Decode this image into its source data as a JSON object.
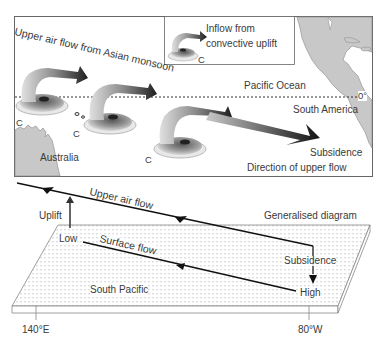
{
  "map": {
    "title_flow": "Upper air flow from Asian monsoon",
    "legend": {
      "line1": "Inflow from",
      "line2": "convective uplift",
      "symbol": "C"
    },
    "ocean_label": "Pacific Ocean",
    "equator_label": "0°",
    "south_america_label": "South America",
    "australia_label": "Australia",
    "subsidence_label": "Subsidence",
    "direction_label": "Direction of upper flow",
    "convection_markers": [
      "C",
      "C",
      "C"
    ]
  },
  "generalised": {
    "title": "Generalised diagram",
    "upper_flow_label": "Upper air flow",
    "uplift_label": "Uplift",
    "low_label": "Low",
    "surface_flow_label": "Surface flow",
    "subsidence_label": "Subsidence",
    "high_label": "High",
    "region_label": "South Pacific",
    "lon_west": "140°E",
    "lon_east": "80°W"
  },
  "colors": {
    "land": "#c8c8c8",
    "arrow_dark": "#1e1e1e",
    "swirl_light": "#e6e6e6",
    "swirl_mid": "#9a9a9a",
    "border": "#555555"
  }
}
